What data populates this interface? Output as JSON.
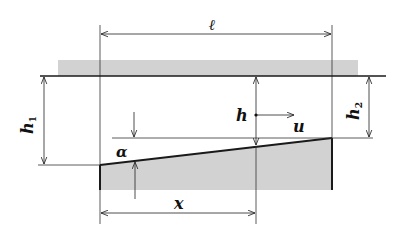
{
  "diagram": {
    "colors": {
      "ink": "#1a1a1a",
      "shade": "#d2d2d2",
      "background": "#ffffff"
    },
    "labels": {
      "length": "ℓ",
      "h1_main": "h",
      "h1_sub": "1",
      "h2_main": "h",
      "h2_sub": "2",
      "depth": "h",
      "velocity": "u",
      "angle": "α",
      "distance": "x"
    }
  }
}
